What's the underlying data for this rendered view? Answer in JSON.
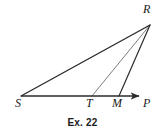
{
  "figure": {
    "caption": "Ex. 22",
    "background_color": "#ffffff",
    "stroke_color": "#2b2b2b",
    "width": 165,
    "height": 138,
    "labels": {
      "apex": "R",
      "left_endpoint": "S",
      "mid_point_1": "T",
      "mid_point_2": "M",
      "ray_endpoint": "P"
    },
    "points": {
      "R": [
        150,
        25
      ],
      "S": [
        21,
        96
      ],
      "T": [
        92,
        96
      ],
      "M": [
        119,
        96
      ],
      "P": [
        146,
        96
      ]
    },
    "segments": [
      {
        "name": "segment-SR",
        "from": "S",
        "to": "R",
        "width": 1.4
      },
      {
        "name": "segment-TR",
        "from": "T",
        "to": "R",
        "width": 0.8
      },
      {
        "name": "segment-MR",
        "from": "M",
        "to": "R",
        "width": 1.2
      },
      {
        "name": "ray-SP",
        "from": "S",
        "to": "P",
        "width": 1.4,
        "arrow": true
      }
    ]
  }
}
